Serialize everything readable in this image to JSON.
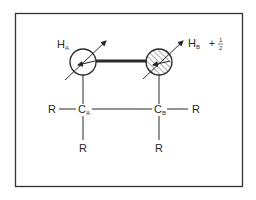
{
  "diagram": {
    "type": "molecular-spin-diagram",
    "colors": {
      "stroke": "#2a2a2a",
      "background": "#ffffff",
      "frame": "#333333"
    },
    "atoms": {
      "h_a": {
        "symbol": "H",
        "subscript": "A",
        "shading": "none"
      },
      "h_b": {
        "symbol": "H",
        "subscript": "B",
        "shading": "hatched"
      },
      "c_a": {
        "symbol": "C",
        "subscript": "A"
      },
      "c_b": {
        "symbol": "C",
        "subscript": "B"
      }
    },
    "substituents": {
      "r_left": "R",
      "r_bottom_a": "R",
      "r_right": "R",
      "r_bottom_b": "R"
    },
    "spin_annotation": {
      "sign": "+",
      "numerator": "1",
      "denominator": "2"
    },
    "bonds": [
      {
        "from": "h_a",
        "to": "h_b",
        "style": "thick"
      },
      {
        "from": "h_a",
        "to": "c_a",
        "style": "single"
      },
      {
        "from": "h_b",
        "to": "c_b",
        "style": "single"
      },
      {
        "from": "c_a",
        "to": "c_b",
        "style": "single"
      },
      {
        "from": "c_a",
        "to": "r_left",
        "style": "single"
      },
      {
        "from": "c_a",
        "to": "r_bottom_a",
        "style": "single"
      },
      {
        "from": "c_b",
        "to": "r_right",
        "style": "single"
      },
      {
        "from": "c_b",
        "to": "r_bottom_b",
        "style": "single"
      }
    ]
  }
}
